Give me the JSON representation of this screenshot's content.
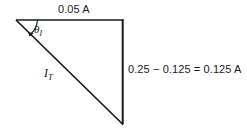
{
  "figure": {
    "type": "current-phasor-right-triangle",
    "background_color": "#ffffff",
    "line_color": "#1a1a1a",
    "text_color": "#1a1a1a",
    "labels": {
      "horizontal_side": "0.05 A",
      "vertical_side": "0.25 − 0.125 = 0.125 A",
      "hypotenuse_symbol": "I",
      "hypotenuse_subscript": "T",
      "angle_symbol": "θ",
      "angle_subscript": "I"
    },
    "geometry": {
      "left_vertex": [
        16,
        20
      ],
      "top_right_vertex": [
        123,
        20
      ],
      "bottom_right_vertex": [
        123,
        124
      ],
      "horizontal_length_px": 107,
      "vertical_length_px": 104
    },
    "values": {
      "horizontal_component": "0.05 A",
      "vertical_expression_minuend": "0.25",
      "vertical_expression_subtrahend": "0.125",
      "vertical_result": "0.125 A"
    }
  }
}
